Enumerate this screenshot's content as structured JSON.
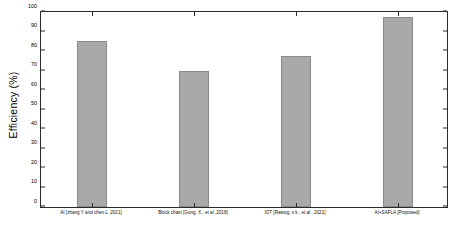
{
  "chart_data": {
    "type": "bar",
    "title": "",
    "xlabel": "",
    "ylabel": "Efficiency (%)",
    "ylim": [
      0,
      100
    ],
    "ytick_step": 10,
    "grid": false,
    "legend": "none",
    "bar_color": "#a9a9a9",
    "bar_edge_color": "#8a8a8a",
    "axis_color": "#2b2b2b",
    "background": "#ffffff",
    "yticks": [
      "0",
      "10",
      "20",
      "30",
      "40",
      "50",
      "60",
      "70",
      "80",
      "90",
      "100"
    ],
    "categories": [
      "AI [zhang Y and chen  L ,2021]",
      "Block chain [Gong, X., et al ,2018]",
      "IOT [Rastog, s k , et al , 2021]",
      "AI+SAFLA [Proposed]"
    ],
    "values": [
      85,
      70,
      77.5,
      97.5
    ]
  }
}
